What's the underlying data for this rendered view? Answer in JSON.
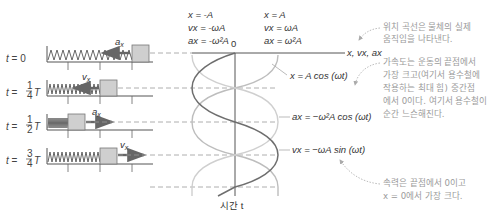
{
  "diagram": {
    "time_rows": [
      {
        "label_t": "t",
        "label_eq": "=",
        "label_val": "0",
        "arrow_label": "a",
        "arrow_sub": "x",
        "arrow_dir": "left"
      },
      {
        "label_t": "t",
        "label_eq": "=",
        "frac_num": "1",
        "frac_den": "4",
        "label_T": "T",
        "arrow_label": "v",
        "arrow_sub": "x",
        "arrow_dir": "left"
      },
      {
        "label_t": "t",
        "label_eq": "=",
        "frac_num": "1",
        "frac_den": "2",
        "label_T": "T",
        "arrow_label": "a",
        "arrow_sub": "x",
        "arrow_dir": "right"
      },
      {
        "label_t": "t",
        "label_eq": "=",
        "frac_num": "3",
        "frac_den": "4",
        "label_T": "T",
        "arrow_label": "v",
        "arrow_sub": "x",
        "arrow_dir": "right"
      }
    ],
    "top_left_values": [
      "x = -A",
      "vx = -ωA",
      "ax = -ω²A"
    ],
    "top_right_values": [
      "x = A",
      "vx = ωA",
      "ax = ω²A"
    ],
    "origin_label": "0",
    "horizontal_axis_label": "x, vx, ax",
    "vertical_axis_label": "시간 t",
    "curves": [
      {
        "name": "position",
        "equation": "x = A cos (ωt)",
        "color": "#b8b8b8"
      },
      {
        "name": "acceleration",
        "equation": "ax = −ω²A cos (ωt)",
        "color": "#c8c8c8"
      },
      {
        "name": "velocity",
        "equation": "vx = −ωA sin (ωt)",
        "color": "#6e6e6e"
      }
    ],
    "notes": [
      {
        "lines": [
          "위치 곡선은 물체의 실제",
          "움직임을 나타낸다."
        ]
      },
      {
        "lines": [
          "가속도는 운동의 끝점에서",
          "가장 크고(여기서 용수철에",
          "작용하는 최대 힘) 중간점",
          "에서 0이다. 여기서 용수철이",
          "순간 느슨해진다."
        ]
      },
      {
        "lines": [
          "속력은 끝점에서 0이고",
          "x = 0에서 가장 크다."
        ]
      }
    ]
  }
}
